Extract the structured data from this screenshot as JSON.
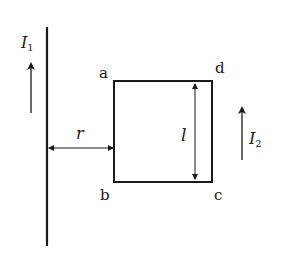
{
  "diagram": {
    "wire": {
      "current_label": "I",
      "current_subscript": "1",
      "current_direction": "up"
    },
    "loop": {
      "corners": {
        "top_left": "a",
        "bottom_left": "b",
        "bottom_right": "c",
        "top_right": "d"
      },
      "side_label": "l",
      "current_label": "I",
      "current_subscript": "2",
      "current_direction": "up"
    },
    "distance_label": "r",
    "colors": {
      "line": "#1a1a1a",
      "background": "#ffffff"
    }
  }
}
